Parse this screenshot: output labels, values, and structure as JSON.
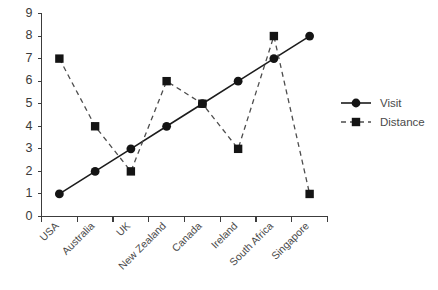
{
  "chart_data": {
    "type": "line",
    "title": "",
    "subtitle": "",
    "xlabel": "",
    "ylabel": "",
    "categories": [
      "USA",
      "Australia",
      "UK",
      "New Zealand",
      "Canada",
      "Ireland",
      "South Africa",
      "Singapore"
    ],
    "series": [
      {
        "name": "Visit",
        "values": [
          1,
          2,
          3,
          4,
          5,
          6,
          7,
          8
        ],
        "line_style": "solid",
        "marker": "circle",
        "color": "#141414"
      },
      {
        "name": "Distance",
        "values": [
          7,
          4,
          2,
          6,
          5,
          3,
          8,
          1
        ],
        "line_style": "dashed",
        "marker": "square",
        "color": "#141414"
      }
    ],
    "ylim": [
      0,
      9
    ],
    "ytick_labels": [
      "0",
      "1",
      "2",
      "3",
      "4",
      "5",
      "6",
      "7",
      "8",
      "9"
    ],
    "ytick_values": [
      0,
      1,
      2,
      3,
      4,
      5,
      6,
      7,
      8,
      9
    ],
    "grid": false,
    "legend_position": "right",
    "xtick_label_rotation": 45,
    "annotations": []
  },
  "legend": {
    "entries": [
      {
        "label": "Visit",
        "marker": "circle-icon",
        "line_style": "solid"
      },
      {
        "label": "Distance",
        "marker": "square-icon",
        "line_style": "dashed"
      }
    ]
  },
  "colors": {
    "background": "#ffffff",
    "axis": "#3c3c3c",
    "text": "#3a3a3a",
    "series_primary": "#141414",
    "series_secondary": "#4d4d4d"
  }
}
